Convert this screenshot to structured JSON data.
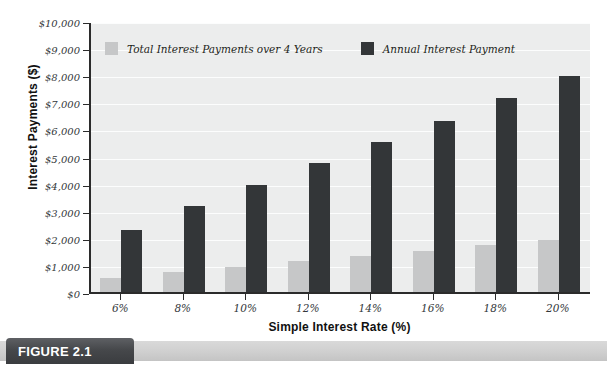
{
  "figure": {
    "caption_label": "FIGURE 2.1"
  },
  "chart_data": {
    "type": "bar",
    "title": "",
    "xlabel": "Simple Interest Rate (%)",
    "ylabel": "Interest Payments ($)",
    "categories": [
      "6%",
      "8%",
      "10%",
      "12%",
      "14%",
      "16%",
      "18%",
      "20%"
    ],
    "series": [
      {
        "name": "Total Interest Payments over 4 Years",
        "color": "#c6c7c8",
        "values": [
          600,
          800,
          1000,
          1200,
          1400,
          1600,
          1800,
          2000
        ]
      },
      {
        "name": "Annual Interest Payment",
        "color": "#333638",
        "values": [
          2350,
          3250,
          4020,
          4850,
          5620,
          6400,
          7250,
          8050
        ]
      }
    ],
    "ylim": [
      0,
      10000
    ],
    "ytick_values": [
      0,
      1000,
      2000,
      3000,
      4000,
      5000,
      6000,
      7000,
      8000,
      9000,
      10000
    ],
    "ytick_labels": [
      "$0",
      "$1,000",
      "$2,000",
      "$3,000",
      "$4,000",
      "$5,000",
      "$6,000",
      "$7,000",
      "$8,000",
      "$9,000",
      "$10,000"
    ],
    "grid": true,
    "legend_position": "top-inside",
    "plot_background": "#eceded"
  }
}
